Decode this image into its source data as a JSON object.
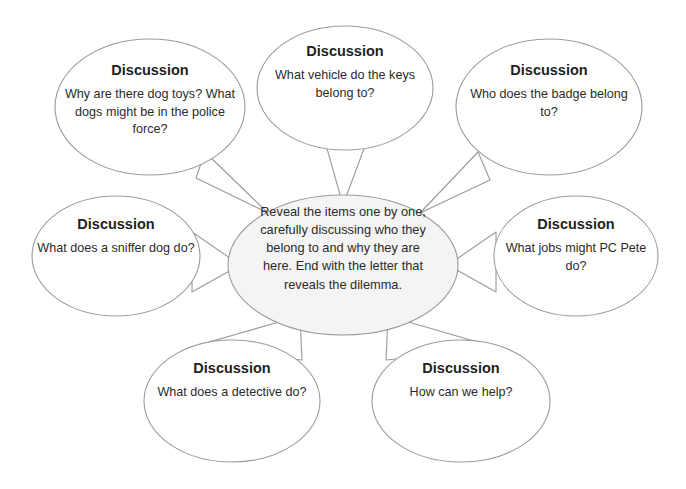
{
  "diagram": {
    "type": "bubble-map",
    "background_color": "#ffffff",
    "outline_color": "#9a9a9a",
    "center_fill_color": "#f4f4f4",
    "text_color": "#231f20",
    "center": {
      "name": "center-bubble",
      "text": "Reveal the items one by one, carefully discussing who they belong to and why they are here. End with the letter that reveals the dilemma."
    },
    "bubbles": [
      {
        "id": "top-left",
        "title": "Discussion",
        "text": "Why are there dog toys? What dogs might be in the police force?"
      },
      {
        "id": "top-center",
        "title": "Discussion",
        "text": "What vehicle do the keys belong to?"
      },
      {
        "id": "top-right",
        "title": "Discussion",
        "text": "Who does the badge belong to?"
      },
      {
        "id": "middle-left",
        "title": "Discussion",
        "text": "What does a sniffer dog do?"
      },
      {
        "id": "middle-right",
        "title": "Discussion",
        "text": "What jobs might PC Pete do?"
      },
      {
        "id": "bottom-left",
        "title": "Discussion",
        "text": "What does a detective do?"
      },
      {
        "id": "bottom-right",
        "title": "Discussion",
        "text": "How can we help?"
      }
    ]
  }
}
